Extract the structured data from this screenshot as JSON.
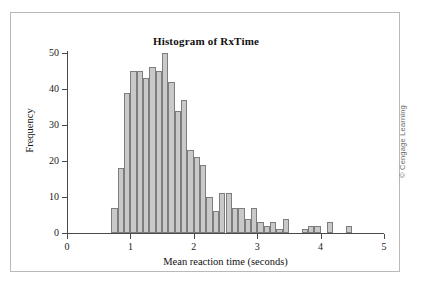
{
  "figure": {
    "copyright": "© Cengage Learning"
  },
  "chart_data": {
    "type": "bar",
    "title": "Histogram of RxTime",
    "xlabel": "Mean reaction time (seconds)",
    "ylabel": "Frequency",
    "xlim": [
      0,
      5
    ],
    "ylim": [
      0,
      50
    ],
    "grid": false,
    "legend": null,
    "bin_width": 0.1,
    "xticks": [
      0,
      1,
      2,
      3,
      4,
      5
    ],
    "xtick_labels": [
      "0",
      "1",
      "2",
      "3",
      "4",
      "5"
    ],
    "yticks": [
      0,
      10,
      20,
      30,
      40,
      50
    ],
    "ytick_labels": [
      "0",
      "10",
      "20",
      "30",
      "40",
      "50"
    ],
    "bar_fill": "#c9c9c9",
    "bar_edge": "#7d7d7d",
    "bins": [
      {
        "x0": 0.7,
        "x1": 0.8,
        "value": 7
      },
      {
        "x0": 0.8,
        "x1": 0.9,
        "value": 18
      },
      {
        "x0": 0.9,
        "x1": 1.0,
        "value": 39
      },
      {
        "x0": 1.0,
        "x1": 1.1,
        "value": 45
      },
      {
        "x0": 1.1,
        "x1": 1.2,
        "value": 45
      },
      {
        "x0": 1.2,
        "x1": 1.3,
        "value": 43
      },
      {
        "x0": 1.3,
        "x1": 1.4,
        "value": 46
      },
      {
        "x0": 1.4,
        "x1": 1.5,
        "value": 45
      },
      {
        "x0": 1.5,
        "x1": 1.6,
        "value": 50
      },
      {
        "x0": 1.6,
        "x1": 1.7,
        "value": 42
      },
      {
        "x0": 1.7,
        "x1": 1.8,
        "value": 34
      },
      {
        "x0": 1.8,
        "x1": 1.9,
        "value": 37
      },
      {
        "x0": 1.9,
        "x1": 2.0,
        "value": 23
      },
      {
        "x0": 2.0,
        "x1": 2.1,
        "value": 21
      },
      {
        "x0": 2.1,
        "x1": 2.2,
        "value": 19
      },
      {
        "x0": 2.2,
        "x1": 2.3,
        "value": 10
      },
      {
        "x0": 2.3,
        "x1": 2.4,
        "value": 6
      },
      {
        "x0": 2.4,
        "x1": 2.5,
        "value": 11
      },
      {
        "x0": 2.5,
        "x1": 2.6,
        "value": 11
      },
      {
        "x0": 2.6,
        "x1": 2.7,
        "value": 7
      },
      {
        "x0": 2.7,
        "x1": 2.8,
        "value": 7
      },
      {
        "x0": 2.8,
        "x1": 2.9,
        "value": 4
      },
      {
        "x0": 2.9,
        "x1": 3.0,
        "value": 7
      },
      {
        "x0": 3.0,
        "x1": 3.1,
        "value": 3
      },
      {
        "x0": 3.1,
        "x1": 3.2,
        "value": 2
      },
      {
        "x0": 3.2,
        "x1": 3.3,
        "value": 3
      },
      {
        "x0": 3.3,
        "x1": 3.4,
        "value": 1
      },
      {
        "x0": 3.4,
        "x1": 3.5,
        "value": 4
      },
      {
        "x0": 3.7,
        "x1": 3.8,
        "value": 1
      },
      {
        "x0": 3.8,
        "x1": 3.9,
        "value": 2
      },
      {
        "x0": 3.9,
        "x1": 4.0,
        "value": 2
      },
      {
        "x0": 4.1,
        "x1": 4.2,
        "value": 3
      },
      {
        "x0": 4.4,
        "x1": 4.5,
        "value": 2
      }
    ]
  }
}
